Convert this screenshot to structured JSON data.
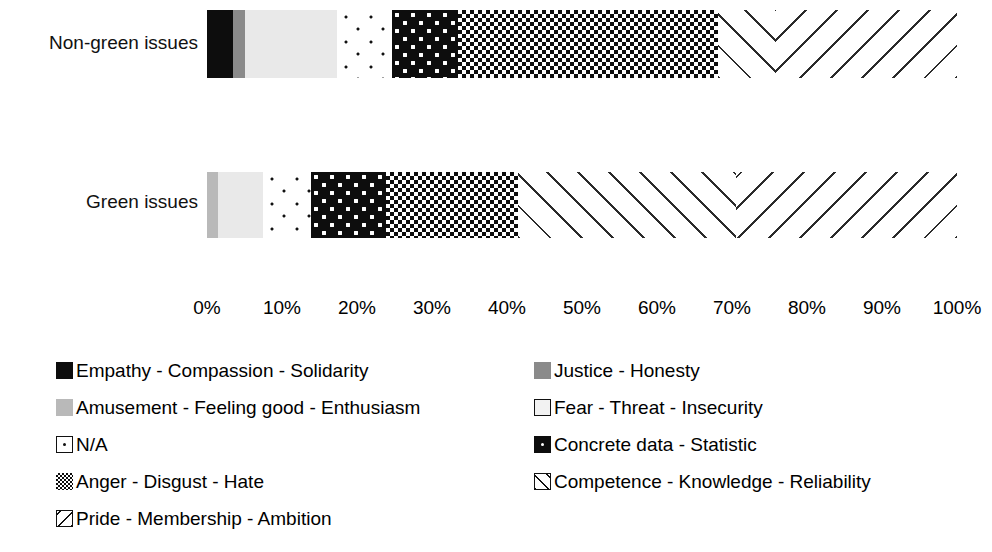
{
  "chart_data": {
    "type": "bar",
    "orientation": "horizontal",
    "stacked": true,
    "normalized_percent": true,
    "title": "",
    "subtitle": "",
    "xlabel": "",
    "ylabel": "",
    "xlim": [
      0,
      100
    ],
    "grid": false,
    "legend_position": "bottom",
    "categories": [
      "Non-green issues",
      "Green issues"
    ],
    "tick_labels": [
      "0%",
      "10%",
      "20%",
      "30%",
      "40%",
      "50%",
      "60%",
      "70%",
      "80%",
      "90%",
      "100%"
    ],
    "tick_values": [
      0,
      10,
      20,
      30,
      40,
      50,
      60,
      70,
      80,
      90,
      100
    ],
    "series": [
      {
        "name": "Empathy - Compassion - Solidarity",
        "pattern": "solid-black",
        "color": "#0d0d0d",
        "values": [
          3.5,
          0
        ]
      },
      {
        "name": "Justice - Honesty",
        "pattern": "solid-dark-gray",
        "color": "#8a8a8a",
        "values": [
          1.5,
          0
        ]
      },
      {
        "name": "Amusement - Feeling good - Enthusiasm",
        "pattern": "solid-medium-gray",
        "color": "#b9b9b9",
        "values": [
          0,
          1.5
        ]
      },
      {
        "name": "Fear - Threat - Insecurity",
        "pattern": "solid-light-gray",
        "color": "#e9e9e9",
        "values": [
          12.3,
          5.9
        ]
      },
      {
        "name": "N/A",
        "pattern": "sparse-dots",
        "color": "#ffffff",
        "values": [
          7.3,
          6.4
        ]
      },
      {
        "name": "Concrete data - Statistic",
        "pattern": "black-white-dots",
        "color": "#0d0d0d",
        "values": [
          8.8,
          10.0
        ]
      },
      {
        "name": "Anger - Disgust - Hate",
        "pattern": "checkerboard",
        "color": "#0d0d0d",
        "values": [
          34.7,
          17.7
        ]
      },
      {
        "name": "Competence - Knowledge - Reliability",
        "pattern": "diagonal-forward",
        "color": "#2b2b2b",
        "values": [
          7.6,
          29.0
        ]
      },
      {
        "name": "Pride - Membership - Ambition",
        "pattern": "diagonal-backward",
        "color": "#2b2b2b",
        "values": [
          24.3,
          29.5
        ]
      }
    ]
  },
  "axis": {
    "ticks": [
      "0%",
      "10%",
      "20%",
      "30%",
      "40%",
      "50%",
      "60%",
      "70%",
      "80%",
      "90%",
      "100%"
    ]
  },
  "bars": [
    {
      "label": "Non-green issues",
      "segments": [
        {
          "series": "Empathy - Compassion - Solidarity",
          "value": 3.5,
          "css": "p-empathy"
        },
        {
          "series": "Justice - Honesty",
          "value": 1.5,
          "css": "p-justice"
        },
        {
          "series": "Fear - Threat - Insecurity",
          "value": 12.3,
          "css": "p-fear"
        },
        {
          "series": "N/A",
          "value": 7.3,
          "css": "p-na"
        },
        {
          "series": "Concrete data - Statistic",
          "value": 8.8,
          "css": "p-concrete"
        },
        {
          "series": "Anger - Disgust - Hate",
          "value": 34.7,
          "css": "p-anger"
        },
        {
          "series": "Competence - Knowledge - Reliability",
          "value": 7.6,
          "css": "p-competence"
        },
        {
          "series": "Pride - Membership - Ambition",
          "value": 24.3,
          "css": "p-pride"
        }
      ]
    },
    {
      "label": "Green issues",
      "segments": [
        {
          "series": "Amusement - Feeling good - Enthusiasm",
          "value": 1.5,
          "css": "p-amusement"
        },
        {
          "series": "Fear - Threat - Insecurity",
          "value": 5.9,
          "css": "p-fear"
        },
        {
          "series": "N/A",
          "value": 6.4,
          "css": "p-na"
        },
        {
          "series": "Concrete data - Statistic",
          "value": 10.0,
          "css": "p-concrete"
        },
        {
          "series": "Anger - Disgust - Hate",
          "value": 17.7,
          "css": "p-anger"
        },
        {
          "series": "Competence - Knowledge - Reliability",
          "value": 29.0,
          "css": "p-competence"
        },
        {
          "series": "Pride - Membership - Ambition",
          "value": 29.5,
          "css": "p-pride"
        }
      ]
    }
  ],
  "legend": {
    "rows": [
      [
        {
          "label": "Empathy - Compassion - Solidarity",
          "swatch": "sw-empathy",
          "outline": false
        },
        {
          "label": "Justice - Honesty",
          "swatch": "sw-justice",
          "outline": false
        }
      ],
      [
        {
          "label": "Amusement - Feeling good - Enthusiasm",
          "swatch": "sw-amusement",
          "outline": false
        },
        {
          "label": "Fear - Threat - Insecurity",
          "swatch": "sw-fear",
          "outline": true
        }
      ],
      [
        {
          "label": "N/A",
          "swatch": "sw-na",
          "outline": true
        },
        {
          "label": "Concrete data - Statistic",
          "swatch": "sw-concrete",
          "outline": false
        }
      ],
      [
        {
          "label": "Anger - Disgust - Hate",
          "swatch": "sw-anger",
          "outline": false
        },
        {
          "label": "Competence - Knowledge - Reliability",
          "swatch": "sw-competence",
          "outline": true
        }
      ],
      [
        {
          "label": "Pride - Membership - Ambition",
          "swatch": "sw-pride",
          "outline": true
        }
      ]
    ]
  }
}
